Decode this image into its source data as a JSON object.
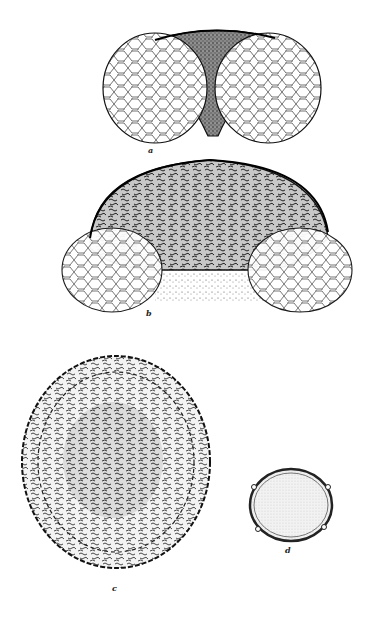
{
  "plate": {
    "figures": [
      {
        "id": "a",
        "label": "a",
        "description": "bisaccate pollen grain, lateral view, dark central body with reticulate sacs"
      },
      {
        "id": "b",
        "label": "b",
        "description": "bisaccate pollen grain with large vermiculate body and reticulate sacs"
      },
      {
        "id": "c",
        "label": "c",
        "description": "round grain with vermiculate sculpture and crenulate margin"
      },
      {
        "id": "d",
        "label": "d",
        "description": "small round stippled grain with thickened wall"
      }
    ]
  }
}
